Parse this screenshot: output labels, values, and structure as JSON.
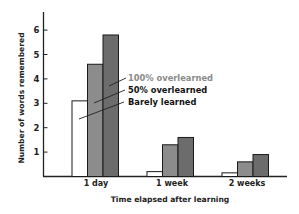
{
  "chart_data": {
    "type": "bar",
    "title": "",
    "xlabel": "Time elapsed after learning",
    "ylabel": "Number of words remembered",
    "categories": [
      "1 day",
      "1 week",
      "2 weeks"
    ],
    "series": [
      {
        "name": "Barely learned",
        "values": [
          3.1,
          0.2,
          0.15
        ],
        "color": "#ffffff"
      },
      {
        "name": "50% overlearned",
        "values": [
          4.6,
          1.3,
          0.6
        ],
        "color": "#8c8c8c"
      },
      {
        "name": "100% overlearned",
        "values": [
          5.8,
          1.6,
          0.9
        ],
        "color": "#6c6c6c"
      }
    ],
    "yticks": [
      1,
      2,
      3,
      4,
      5,
      6
    ],
    "ylim": [
      0,
      6.7
    ],
    "grid": false,
    "legend": {
      "position": "annotations with leader lines pointing to 1-day bars",
      "entries": [
        {
          "label": "100% overlearned",
          "text_color": "#8a8a8a"
        },
        {
          "label": "50% overlearned",
          "text_color": "#111111"
        },
        {
          "label": "Barely learned",
          "text_color": "#111111"
        }
      ]
    }
  },
  "axes": {
    "y_title": "Number of words remembered",
    "x_title": "Time elapsed after learning",
    "y_ticks": [
      "1",
      "2",
      "3",
      "4",
      "5",
      "6"
    ]
  },
  "labels": {
    "cat0": "1 day",
    "cat1": "1 week",
    "cat2": "2 weeks",
    "legend0": "100% overlearned",
    "legend1": "50% overlearned",
    "legend2": "Barely learned"
  }
}
